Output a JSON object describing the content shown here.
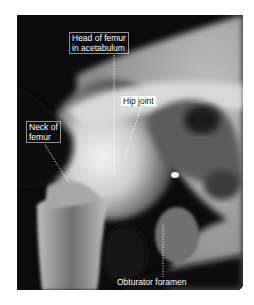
{
  "figure": {
    "type": "x-ray",
    "labels": [
      {
        "id": "head_of_femur",
        "lines": [
          "Head of femur",
          "in acetabulum"
        ]
      },
      {
        "id": "hip_joint",
        "lines": [
          "Hip joint"
        ]
      },
      {
        "id": "neck_of_femur",
        "lines": [
          "Neck of",
          "femur"
        ]
      },
      {
        "id": "obturator_foramen",
        "lines": [
          "Obturator foramen"
        ]
      }
    ]
  },
  "colors": {
    "background": "#ffffff",
    "xray_dark": "#0b0b0b",
    "bone_light": "#e6e6e6",
    "label_text": "#ffffff"
  }
}
